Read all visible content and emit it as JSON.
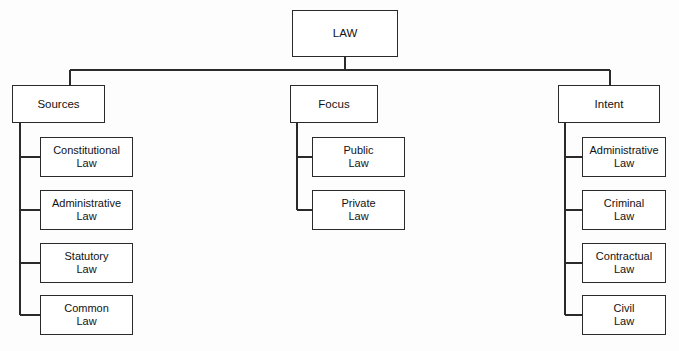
{
  "diagram": {
    "title": "LAW",
    "root": {
      "label": "LAW",
      "x": 292,
      "y": 10,
      "w": 106,
      "h": 47
    },
    "bus": {
      "y": 70,
      "x_start": 70,
      "x_end": 610,
      "stub_x": 345
    },
    "branches": [
      {
        "key": "sources",
        "label": "Sources",
        "x": 12,
        "y": 85,
        "w": 93,
        "h": 38,
        "spine_x": 20,
        "leaves": [
          {
            "label": "Constitutional\nLaw",
            "x": 40,
            "y": 137,
            "w": 93,
            "h": 40
          },
          {
            "label": "Administrative\nLaw",
            "x": 40,
            "y": 190,
            "w": 93,
            "h": 40
          },
          {
            "label": "Statutory\nLaw",
            "x": 40,
            "y": 243,
            "w": 93,
            "h": 40
          },
          {
            "label": "Common\nLaw",
            "x": 40,
            "y": 295,
            "w": 93,
            "h": 40
          }
        ]
      },
      {
        "key": "focus",
        "label": "Focus",
        "x": 290,
        "y": 85,
        "w": 88,
        "h": 38,
        "spine_x": 297,
        "leaves": [
          {
            "label": "Public\nLaw",
            "x": 312,
            "y": 137,
            "w": 93,
            "h": 40
          },
          {
            "label": "Private\nLaw",
            "x": 312,
            "y": 190,
            "w": 93,
            "h": 40
          }
        ]
      },
      {
        "key": "intent",
        "label": "Intent",
        "x": 558,
        "y": 85,
        "w": 102,
        "h": 38,
        "spine_x": 565,
        "leaves": [
          {
            "label": "Administrative\nLaw",
            "x": 582,
            "y": 137,
            "w": 84,
            "h": 40
          },
          {
            "label": "Criminal\nLaw",
            "x": 582,
            "y": 190,
            "w": 84,
            "h": 40
          },
          {
            "label": "Contractual\nLaw",
            "x": 582,
            "y": 243,
            "w": 84,
            "h": 40
          },
          {
            "label": "Civil\nLaw",
            "x": 582,
            "y": 295,
            "w": 84,
            "h": 40
          }
        ]
      }
    ],
    "style": {
      "line_color": "#2a2a2a",
      "box_fill": "#ffffff",
      "text_color": "#121212",
      "background": "#fdfdfd"
    }
  }
}
